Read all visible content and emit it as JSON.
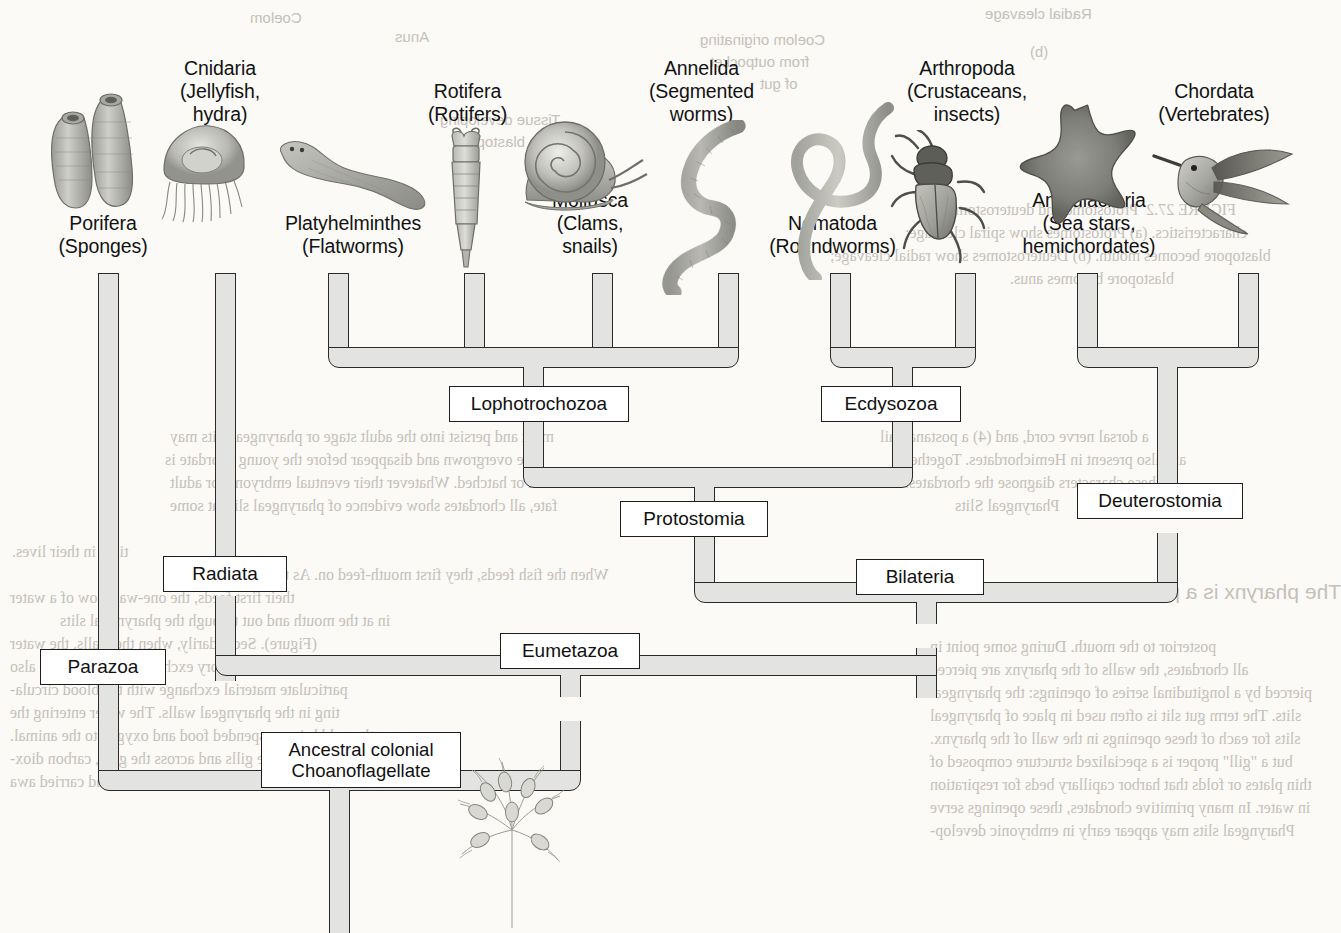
{
  "figure": {
    "kind": "phylogenetic-cladogram",
    "root_label": "Ancestral colonial Choanoflagellate"
  },
  "taxa": [
    {
      "id": "porifera",
      "name": "Porifera",
      "common": "(Sponges)",
      "icon": "sponge-illustration"
    },
    {
      "id": "cnidaria",
      "name": "Cnidaria",
      "common": "(Jellyfish,\nhydra)",
      "icon": "jellyfish-illustration"
    },
    {
      "id": "platyhelminthes",
      "name": "Platyhelminthes",
      "common": "(Flatworms)",
      "icon": "flatworm-illustration"
    },
    {
      "id": "rotifera",
      "name": "Rotifera",
      "common": "(Rotifers)",
      "icon": "rotifer-illustration"
    },
    {
      "id": "mollusca",
      "name": "Mollusca",
      "common": "(Clams,\nsnails)",
      "icon": "snail-illustration"
    },
    {
      "id": "annelida",
      "name": "Annelida",
      "common": "(Segmented\nworms)",
      "icon": "segmented-worm-illustration"
    },
    {
      "id": "nematoda",
      "name": "Nematoda",
      "common": "(Roundworms)",
      "icon": "roundworm-illustration"
    },
    {
      "id": "arthropoda",
      "name": "Arthropoda",
      "common": "(Crustaceans,\ninsects)",
      "icon": "beetle-illustration"
    },
    {
      "id": "ambulacraria",
      "name": "Ambulacraria",
      "common": "(Sea stars,\nhemichordates)",
      "icon": "sea-star-illustration"
    },
    {
      "id": "chordata",
      "name": "Chordata",
      "common": "(Vertebrates)",
      "icon": "hummingbird-illustration"
    }
  ],
  "clades": [
    {
      "id": "lophotrochozoa",
      "label": "Lophotrochozoa",
      "children": [
        "platyhelminthes",
        "rotifera",
        "mollusca",
        "annelida"
      ]
    },
    {
      "id": "ecdysozoa",
      "label": "Ecdysozoa",
      "children": [
        "nematoda",
        "arthropoda"
      ]
    },
    {
      "id": "protostomia",
      "label": "Protostomia",
      "children": [
        "lophotrochozoa",
        "ecdysozoa"
      ]
    },
    {
      "id": "deuterostomia",
      "label": "Deuterostomia",
      "children": [
        "ambulacraria",
        "chordata"
      ]
    },
    {
      "id": "bilateria",
      "label": "Bilateria",
      "children": [
        "protostomia",
        "deuterostomia"
      ]
    },
    {
      "id": "radiata",
      "label": "Radiata",
      "children": [
        "cnidaria"
      ]
    },
    {
      "id": "eumetazoa",
      "label": "Eumetazoa",
      "children": [
        "radiata",
        "bilateria"
      ]
    },
    {
      "id": "parazoa",
      "label": "Parazoa",
      "children": [
        "porifera"
      ]
    },
    {
      "id": "ancestor",
      "label": "Ancestral colonial\nChoanoflagellate",
      "children": [
        "parazoa",
        "eumetazoa"
      ]
    }
  ],
  "colors": {
    "branch_fill": "#e3e3e1",
    "branch_stroke": "#2a2a2a",
    "box_fill": "#ffffff",
    "box_stroke": "#1d1d1d",
    "page_background": "#fbfaf7",
    "text": "#121212",
    "bleed_text": "#b9b4ac"
  },
  "bleed_through": {
    "note": "mirror-image show-through text from the reverse side of the scanned book page",
    "lines": [
      {
        "id": "bt-top-1",
        "text": "Radial cleavage"
      },
      {
        "id": "bt-top-2",
        "text": "(b)"
      },
      {
        "id": "bt-top-3",
        "text": "Coelom originating"
      },
      {
        "id": "bt-top-4",
        "text": "from outpocket"
      },
      {
        "id": "bt-top-5",
        "text": "of gut"
      },
      {
        "id": "bt-top-6",
        "text": "Anus"
      },
      {
        "id": "bt-top-7",
        "text": "Coelom"
      },
      {
        "id": "bt-top-8",
        "text": "Tissue developing"
      },
      {
        "id": "bt-top-9",
        "text": "from blastopore"
      },
      {
        "id": "bt-mid-1",
        "text": "FIGURE 27.2  Protostome and deuterostome"
      },
      {
        "id": "bt-mid-2",
        "text": "characteristics. (a) Protostomes show spiral cleavage;"
      },
      {
        "id": "bt-mid-3",
        "text": "blastopore becomes mouth. (b) Deuterostomes show radial cleavage;"
      },
      {
        "id": "bt-mid-4",
        "text": "blastopore becomes anus."
      },
      {
        "id": "bt-mid-5",
        "text": "a notochord, an endostyle (thyroid gland)"
      },
      {
        "id": "bt-mid-6",
        "text": "a dorsal nerve cord, and (4) a postanal tail"
      },
      {
        "id": "bt-mid-7",
        "text": "are also present in Hemichordates. Together"
      },
      {
        "id": "bt-mid-8",
        "text": "these characters diagnose the chordates."
      },
      {
        "id": "bt-mid-9",
        "text": "Pharyngeal Slits"
      },
      {
        "id": "bt-mid-10",
        "text": "The pharynx is a part of the digestive tract"
      },
      {
        "id": "bt-mid-11",
        "text": "posterior to the mouth. During some point in"
      },
      {
        "id": "bt-mid-12",
        "text": "all chordates, the walls of the pharynx are pierced"
      },
      {
        "id": "bt-mid-13",
        "text": "pierced by a longitudinal series of openings: the pharyngeal"
      },
      {
        "id": "bt-mid-14",
        "text": "slits. The term gut slit is often used in place of pharyngeal"
      },
      {
        "id": "bt-mid-15",
        "text": "slits for each of these openings in the wall of the pharynx."
      },
      {
        "id": "bt-mid-16",
        "text": "but a \"gill\" proper is a specialized structure composed of"
      },
      {
        "id": "bt-mid-17",
        "text": "thin plates or folds that harbor capillary beds for respiration"
      },
      {
        "id": "bt-mid-18",
        "text": "in water. In many primitive chordates, these openings serve"
      },
      {
        "id": "bt-l-1",
        "text": "Pharyngeal slits may appear early in embryonic develop-"
      },
      {
        "id": "bt-l-2",
        "text": "ment and persist into the adult stage or pharyngeal slits may"
      },
      {
        "id": "bt-l-3",
        "text": "be overgrown and disappear before the young chordate is"
      },
      {
        "id": "bt-l-4",
        "text": "born or hatched. Whatever their eventual embryonic or adult"
      },
      {
        "id": "bt-l-5",
        "text": "fate, all chordates show evidence of pharyngeal slits at some"
      },
      {
        "id": "bt-l-6",
        "text": "time in their lives."
      },
      {
        "id": "bt-l-7",
        "text": "When the fish feeds, they first mouth-feed on. As the water"
      },
      {
        "id": "bt-l-8",
        "text": "their first feeds, the one-way flow of a water"
      },
      {
        "id": "bt-l-9",
        "text": "in at the mouth and out through the pharyngeal slits"
      },
      {
        "id": "bt-l-10",
        "text": "(Figure). Secondarily, when the walls, the water"
      },
      {
        "id": "bt-l-11",
        "text": "becomes a respiratory exchange surface where also"
      },
      {
        "id": "bt-l-12",
        "text": "particulate material exchange with the blood circula-"
      },
      {
        "id": "bt-l-13",
        "text": "ting in the pharyngeal walls. The water entering the"
      },
      {
        "id": "bt-l-14",
        "text": "mouth could bring suspended food and oxygen to the animal."
      },
      {
        "id": "bt-l-15",
        "text": "As it exits through the gills and across the gills, carbon diox-"
      },
      {
        "id": "bt-l-16",
        "text": "ide was given off to the departing water and carried awa"
      }
    ]
  }
}
